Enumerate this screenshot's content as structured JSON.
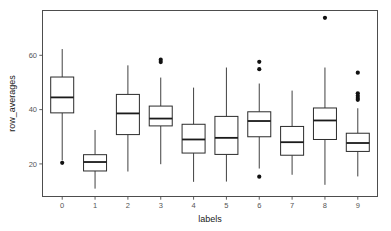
{
  "chart_data": {
    "type": "box",
    "title": "",
    "xlabel": "labels",
    "ylabel": "row_averages",
    "grid": false,
    "legend": null,
    "xlim": [
      -0.6,
      9.6
    ],
    "ylim": [
      8.0,
      76.5
    ],
    "x_tick_labels": [
      "0",
      "1",
      "2",
      "3",
      "4",
      "5",
      "6",
      "7",
      "8",
      "9"
    ],
    "y_tick_labels": [
      "20",
      "40",
      "60"
    ],
    "y_ticks": [
      20,
      40,
      60
    ],
    "categories": [
      "0",
      "1",
      "2",
      "3",
      "4",
      "5",
      "6",
      "7",
      "8",
      "9"
    ],
    "boxes": [
      {
        "category": "0",
        "whisker_low": 21.3,
        "q1": 38.8,
        "median": 44.5,
        "q3": 52.0,
        "whisker_high": 62.3,
        "outliers": [
          20.4
        ]
      },
      {
        "category": "1",
        "whisker_low": 10.9,
        "q1": 17.4,
        "median": 20.7,
        "q3": 23.4,
        "whisker_high": 32.5,
        "outliers": []
      },
      {
        "category": "2",
        "whisker_low": 17.2,
        "q1": 30.8,
        "median": 38.6,
        "q3": 45.6,
        "whisker_high": 56.3,
        "outliers": []
      },
      {
        "category": "3",
        "whisker_low": 19.9,
        "q1": 34.0,
        "median": 36.7,
        "q3": 41.3,
        "whisker_high": 51.8,
        "outliers": [
          57.5,
          58.4
        ]
      },
      {
        "category": "4",
        "whisker_low": 13.4,
        "q1": 24.0,
        "median": 29.0,
        "q3": 34.6,
        "whisker_high": 48.1,
        "outliers": []
      },
      {
        "category": "5",
        "whisker_low": 13.5,
        "q1": 23.5,
        "median": 29.6,
        "q3": 37.5,
        "whisker_high": 55.5,
        "outliers": []
      },
      {
        "category": "6",
        "whisker_low": 18.3,
        "q1": 30.0,
        "median": 35.8,
        "q3": 39.2,
        "whisker_high": 49.6,
        "outliers": [
          57.6,
          54.9,
          15.3
        ]
      },
      {
        "category": "7",
        "whisker_low": 16.0,
        "q1": 23.2,
        "median": 28.0,
        "q3": 33.8,
        "whisker_high": 47.0,
        "outliers": []
      },
      {
        "category": "8",
        "whisker_low": 12.3,
        "q1": 29.0,
        "median": 36.0,
        "q3": 40.6,
        "whisker_high": 55.5,
        "outliers": [
          73.8
        ]
      },
      {
        "category": "9",
        "whisker_low": 15.4,
        "q1": 24.6,
        "median": 27.7,
        "q3": 31.3,
        "whisker_high": 40.5,
        "outliers": [
          53.6,
          46.0,
          45.1,
          44.3,
          43.6
        ]
      }
    ],
    "colors": {
      "box_fill": "#ffffff",
      "box_stroke": "#2b2b2b",
      "median": "#1a1a1a",
      "outlier": "#111111",
      "panel_border": "#4d4d4d",
      "tick_text": "#555555",
      "axis_title": "#1a1a1a",
      "background": "#ffffff"
    }
  }
}
